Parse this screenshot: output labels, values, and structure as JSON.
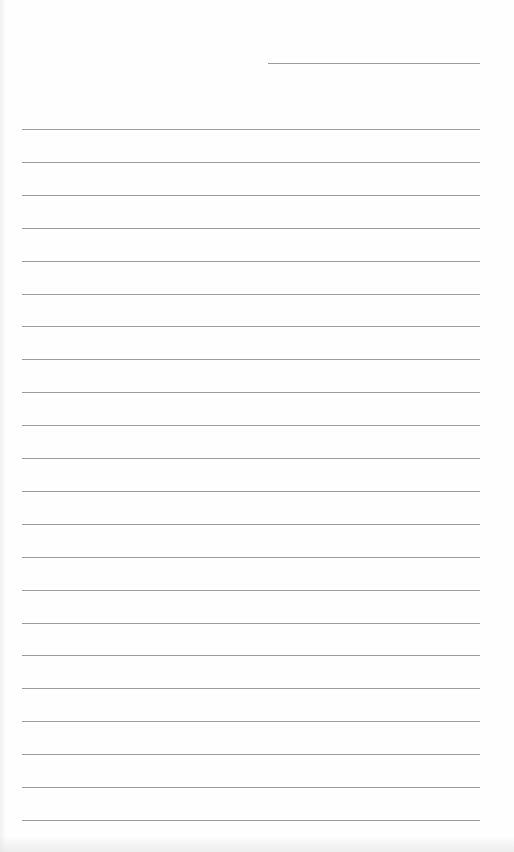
{
  "document": {
    "type": "lined-paper",
    "background_color": "#fefefe",
    "rule_color": "#8a8a8a",
    "header_line": {
      "x": 268,
      "y": 63,
      "width": 212
    },
    "ruled_lines": {
      "count": 22,
      "start_y": 129,
      "spacing": 32.9,
      "x": 22,
      "width": 458
    }
  }
}
